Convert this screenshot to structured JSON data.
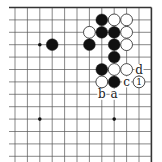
{
  "board": {
    "columns": 12,
    "rows_visible": 13,
    "origin_x": 15,
    "origin_y": 7.5,
    "step": 12.4,
    "edges": {
      "top": true,
      "right": true,
      "left": false,
      "bottom": false
    },
    "line_color": "#555555",
    "edge_color": "#333333",
    "star_points": [
      {
        "col": 2,
        "row": 3
      },
      {
        "col": 2,
        "row": 9
      },
      {
        "col": 8,
        "row": 9
      }
    ]
  },
  "stones": [
    {
      "color": "black",
      "col": 7,
      "row": 1
    },
    {
      "color": "white",
      "col": 8,
      "row": 1
    },
    {
      "color": "white",
      "col": 9,
      "row": 1
    },
    {
      "color": "white",
      "col": 6,
      "row": 2
    },
    {
      "color": "black",
      "col": 7,
      "row": 2
    },
    {
      "color": "black",
      "col": 8,
      "row": 2
    },
    {
      "color": "white",
      "col": 9,
      "row": 2
    },
    {
      "color": "black",
      "col": 3,
      "row": 3
    },
    {
      "color": "black",
      "col": 6,
      "row": 3
    },
    {
      "color": "black",
      "col": 8,
      "row": 3
    },
    {
      "color": "white",
      "col": 9,
      "row": 3
    },
    {
      "color": "black",
      "col": 8,
      "row": 4
    },
    {
      "color": "black",
      "col": 7,
      "row": 5
    },
    {
      "color": "white",
      "col": 8,
      "row": 5
    },
    {
      "color": "white",
      "col": 9,
      "row": 5
    },
    {
      "color": "white",
      "col": 7,
      "row": 6
    },
    {
      "color": "black",
      "col": 8,
      "row": 6
    },
    {
      "color": "white",
      "col": 10,
      "row": 6,
      "label": "1"
    }
  ],
  "markers": [
    {
      "label": "d",
      "col": 10,
      "row": 5
    },
    {
      "label": "c",
      "col": 9,
      "row": 6
    },
    {
      "label": "b",
      "col": 7,
      "row": 7
    },
    {
      "label": "a",
      "col": 8,
      "row": 7
    }
  ]
}
